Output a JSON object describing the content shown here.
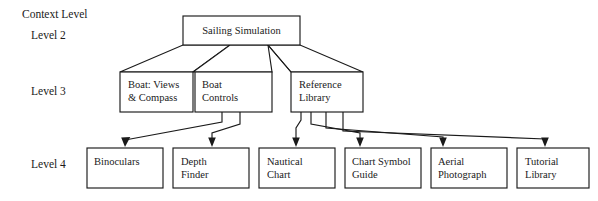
{
  "diagram": {
    "type": "hierarchy-tree",
    "background_color": "#ffffff",
    "line_color": "#1a1a1a",
    "box_fill_color": "#ffffff",
    "level_labels": [
      {
        "id": "context-level",
        "text": "Context Level"
      },
      {
        "id": "level-2",
        "text": "Level 2"
      },
      {
        "id": "level-3",
        "text": "Level 3"
      },
      {
        "id": "level-4",
        "text": "Level 4"
      }
    ],
    "root": {
      "id": "sailing-simulation",
      "label": "Sailing Simulation"
    },
    "level3_nodes": [
      {
        "id": "boat-views-compass",
        "line1": "Boat: Views",
        "line2": "& Compass"
      },
      {
        "id": "boat-controls",
        "line1": "Boat",
        "line2": "Controls"
      },
      {
        "id": "reference-library",
        "line1": "Reference",
        "line2": "Library"
      }
    ],
    "level4_nodes": [
      {
        "id": "binoculars",
        "line1": "Binoculars",
        "line2": ""
      },
      {
        "id": "depth-finder",
        "line1": "Depth",
        "line2": "Finder"
      },
      {
        "id": "nautical-chart",
        "line1": "Nautical",
        "line2": "Chart"
      },
      {
        "id": "chart-symbol-guide",
        "line1": "Chart Symbol",
        "line2": "Guide"
      },
      {
        "id": "aerial-photograph",
        "line1": "Aerial",
        "line2": "Photograph"
      },
      {
        "id": "tutorial-library",
        "line1": "Tutorial",
        "line2": "Library"
      }
    ]
  }
}
